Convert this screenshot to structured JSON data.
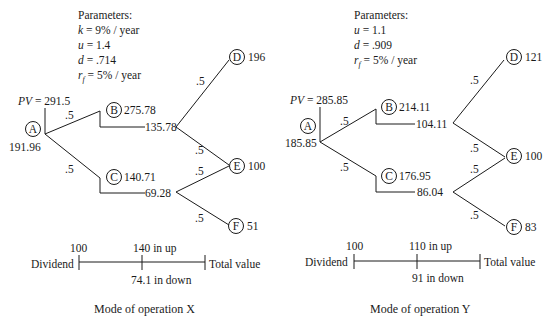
{
  "panels": [
    {
      "caption": "Mode of operation X",
      "parameters": {
        "title": "Parameters:",
        "lines": [
          {
            "var": "k",
            "rest": " = 9% / year"
          },
          {
            "var": "u",
            "rest": " = 1.4"
          },
          {
            "var": "d",
            "rest": " = .714"
          },
          {
            "var": "r",
            "sub": "f",
            "rest": " = 5% / year"
          }
        ]
      },
      "pv_label": "PV",
      "pv_value": " = 291.5",
      "nodes": {
        "A": {
          "label": "A",
          "value": "191.96"
        },
        "B": {
          "label": "B",
          "value": "275.78",
          "net": "135.78"
        },
        "C": {
          "label": "C",
          "value": "140.71",
          "net": "69.28"
        },
        "D": {
          "label": "D",
          "value": "196"
        },
        "E": {
          "label": "E",
          "value": "100"
        },
        "F": {
          "label": "F",
          "value": "51"
        }
      },
      "probabilities": [
        ".5",
        ".5",
        ".5",
        ".5",
        ".5",
        ".5"
      ],
      "timeline": {
        "dividend_label": "Dividend",
        "dividend_value": "100",
        "up_label": "140 in up",
        "down_label": "74.1 in down",
        "end_label": "Total value"
      }
    },
    {
      "caption": "Mode of operation Y",
      "parameters": {
        "title": "Parameters:",
        "lines": [
          {
            "var": "u",
            "rest": " = 1.1"
          },
          {
            "var": "d",
            "rest": " = .909"
          },
          {
            "var": "r",
            "sub": "f",
            "rest": " = 5% / year"
          }
        ]
      },
      "pv_label": "PV",
      "pv_value": " = 285.85",
      "nodes": {
        "A": {
          "label": "A",
          "value": "185.85"
        },
        "B": {
          "label": "B",
          "value": "214.11",
          "net": "104.11"
        },
        "C": {
          "label": "C",
          "value": "176.95",
          "net": "86.04"
        },
        "D": {
          "label": "D",
          "value": "121"
        },
        "E": {
          "label": "E",
          "value": "100"
        },
        "F": {
          "label": "F",
          "value": "83"
        }
      },
      "probabilities": [
        ".5",
        ".5",
        ".5",
        ".5",
        ".5",
        ".5"
      ],
      "timeline": {
        "dividend_label": "Dividend",
        "dividend_value": "100",
        "up_label": "110 in up",
        "down_label": "91 in down",
        "end_label": "Total value"
      }
    }
  ]
}
